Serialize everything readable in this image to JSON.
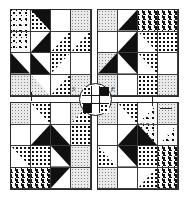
{
  "figure": {
    "type": "quilt-block-diagram",
    "background_color": "#ffffff",
    "ink_color": "#1a1a1a",
    "block_count": 4,
    "block_grid": "2x2",
    "cells_per_block": "4x4",
    "center_medallion": {
      "shape": "circle",
      "inner_shape": "cross",
      "label": ""
    },
    "corner_marks": [
      {
        "id": "mark-tl",
        "text": "S"
      },
      {
        "id": "mark-tr",
        "text": "E"
      }
    ],
    "blocks": [
      {
        "id": "block-top-left",
        "name": "Top left block",
        "cells": [
          {
            "fill": "speck",
            "overlay": "none"
          },
          {
            "fill": "dot",
            "overlay": "tri-tr-black"
          },
          {
            "fill": "white",
            "overlay": "none"
          },
          {
            "fill": "light",
            "overlay": "none"
          },
          {
            "fill": "speck",
            "overlay": "none"
          },
          {
            "fill": "black",
            "overlay": "none"
          },
          {
            "fill": "white",
            "overlay": "tri-br-dot"
          },
          {
            "fill": "dot",
            "overlay": "tri-tl-white"
          },
          {
            "fill": "white",
            "overlay": "tri-bl-black"
          },
          {
            "fill": "black",
            "overlay": "tri-tr-white"
          },
          {
            "fill": "dot",
            "overlay": "none"
          },
          {
            "fill": "white",
            "overlay": "none"
          },
          {
            "fill": "light",
            "overlay": "none"
          },
          {
            "fill": "light",
            "overlay": "tri-tr-white"
          },
          {
            "fill": "white",
            "overlay": "tri-br-dot"
          },
          {
            "fill": "light",
            "overlay": "none"
          }
        ]
      },
      {
        "id": "block-top-right",
        "name": "Top right block",
        "cells": [
          {
            "fill": "light",
            "overlay": "none"
          },
          {
            "fill": "white",
            "overlay": "tri-br-black"
          },
          {
            "fill": "dash",
            "overlay": "none"
          },
          {
            "fill": "dash",
            "overlay": "none"
          },
          {
            "fill": "white",
            "overlay": "none"
          },
          {
            "fill": "black",
            "overlay": "tri-tl-white"
          },
          {
            "fill": "white",
            "overlay": "tri-tr-dot"
          },
          {
            "fill": "dot",
            "overlay": "none"
          },
          {
            "fill": "light",
            "overlay": "tri-br-black"
          },
          {
            "fill": "black",
            "overlay": "none"
          },
          {
            "fill": "dot",
            "overlay": "tri-bl-white"
          },
          {
            "fill": "white",
            "overlay": "none"
          },
          {
            "fill": "light",
            "overlay": "none"
          },
          {
            "fill": "white",
            "overlay": "none"
          },
          {
            "fill": "dot",
            "overlay": "none"
          },
          {
            "fill": "light",
            "overlay": "none"
          }
        ]
      },
      {
        "id": "block-bottom-left",
        "name": "Bottom left block",
        "cells": [
          {
            "fill": "light",
            "overlay": "none"
          },
          {
            "fill": "dot",
            "overlay": "tri-bl-white"
          },
          {
            "fill": "white",
            "overlay": "none"
          },
          {
            "fill": "light",
            "overlay": "tri-br-dot"
          },
          {
            "fill": "white",
            "overlay": "none"
          },
          {
            "fill": "white",
            "overlay": "tri-br-black"
          },
          {
            "fill": "black",
            "overlay": "tri-tr-white"
          },
          {
            "fill": "dot",
            "overlay": "none"
          },
          {
            "fill": "white",
            "overlay": "tri-tr-dot"
          },
          {
            "fill": "dot",
            "overlay": "none"
          },
          {
            "fill": "black",
            "overlay": "tri-bl-white"
          },
          {
            "fill": "light",
            "overlay": "none"
          },
          {
            "fill": "dash",
            "overlay": "none"
          },
          {
            "fill": "dash",
            "overlay": "none"
          },
          {
            "fill": "white",
            "overlay": "tri-tl-black"
          },
          {
            "fill": "light",
            "overlay": "none"
          }
        ]
      },
      {
        "id": "block-bottom-right",
        "name": "Bottom right block",
        "cells": [
          {
            "fill": "light",
            "overlay": "none"
          },
          {
            "fill": "dot",
            "overlay": "tri-bl-white"
          },
          {
            "fill": "white",
            "overlay": "tri-br-speck"
          },
          {
            "fill": "light",
            "overlay": "none"
          },
          {
            "fill": "white",
            "overlay": "none"
          },
          {
            "fill": "white",
            "overlay": "tri-br-black"
          },
          {
            "fill": "black",
            "overlay": "none"
          },
          {
            "fill": "speck",
            "overlay": "tri-tl-white"
          },
          {
            "fill": "dot",
            "overlay": "tri-tr-white"
          },
          {
            "fill": "black",
            "overlay": "none"
          },
          {
            "fill": "dot",
            "overlay": "none"
          },
          {
            "fill": "dash",
            "overlay": "none"
          },
          {
            "fill": "light",
            "overlay": "none"
          },
          {
            "fill": "white",
            "overlay": "none"
          },
          {
            "fill": "dot",
            "overlay": "tri-tl-white"
          },
          {
            "fill": "dash",
            "overlay": "none"
          }
        ]
      }
    ],
    "leaders": [
      {
        "id": "leader-top",
        "orientation": "vertical"
      },
      {
        "id": "leader-right",
        "orientation": "horizontal"
      },
      {
        "id": "leader-bottom-left",
        "orientation": "diagonal"
      }
    ]
  }
}
